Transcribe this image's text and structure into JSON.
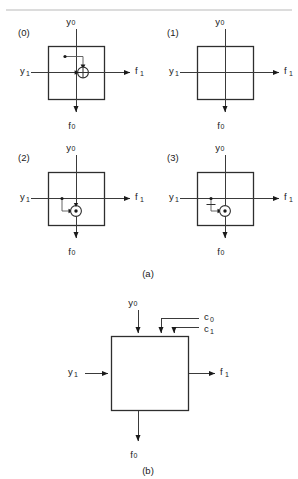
{
  "figure": {
    "caption_a": "(a)",
    "caption_b": "(b)",
    "colors": {
      "ink": "#1a1a1a",
      "wire": "#3a3a3a",
      "box": "#2e2e2e",
      "rule": "#b9b9b9",
      "background": "#ffffff"
    }
  },
  "part_a": {
    "cells": [
      {
        "index_label": "(0)",
        "input_vertical": "y",
        "input_vertical_sub": "0",
        "input_horizontal": "y",
        "input_horizontal_sub": "1",
        "output_horizontal": "f",
        "output_horizontal_sub": "1",
        "output_vertical": "f",
        "output_vertical_sub": "0",
        "gate": "xor",
        "gate_symbol": "plus-in-circle",
        "tap_source": "vertical",
        "inverted_branch": false
      },
      {
        "index_label": "(1)",
        "input_vertical": "y",
        "input_vertical_sub": "0",
        "input_horizontal": "y",
        "input_horizontal_sub": "1",
        "output_horizontal": "f",
        "output_horizontal_sub": "1",
        "output_vertical": "f",
        "output_vertical_sub": "0",
        "gate": "none",
        "gate_symbol": "none",
        "tap_source": "none",
        "inverted_branch": false
      },
      {
        "index_label": "(2)",
        "input_vertical": "y",
        "input_vertical_sub": "0",
        "input_horizontal": "y",
        "input_horizontal_sub": "1",
        "output_horizontal": "f",
        "output_horizontal_sub": "1",
        "output_vertical": "f",
        "output_vertical_sub": "0",
        "gate": "xnor",
        "gate_symbol": "dot-in-circle",
        "tap_source": "horizontal",
        "inverted_branch": false
      },
      {
        "index_label": "(3)",
        "index_label_alt": "(3)",
        "input_vertical": "y",
        "input_vertical_sub": "0",
        "input_horizontal": "y",
        "input_horizontal_sub": "1",
        "output_horizontal": "f",
        "output_horizontal_sub": "1",
        "output_vertical": "f",
        "output_vertical_sub": "0",
        "gate": "xnor",
        "gate_symbol": "dot-in-circle",
        "tap_source": "horizontal",
        "inverted_branch": true
      }
    ]
  },
  "part_b": {
    "input_vertical": "y",
    "input_vertical_sub": "0",
    "input_horizontal": "y",
    "input_horizontal_sub": "1",
    "control_0": "c",
    "control_0_sub": "0",
    "control_1": "c",
    "control_1_sub": "1",
    "output_horizontal": "f",
    "output_horizontal_sub": "1",
    "output_vertical": "f",
    "output_vertical_sub": "0"
  }
}
